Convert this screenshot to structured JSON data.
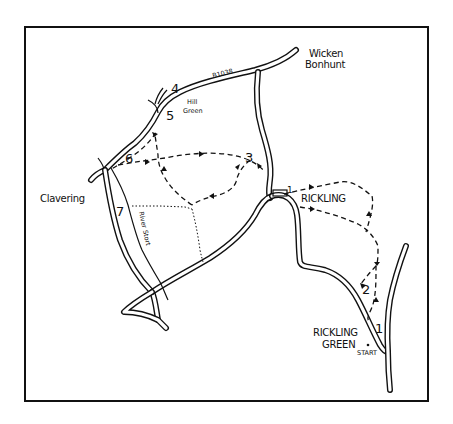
{
  "map": {
    "type": "hand-drawn walking route map",
    "frame": {
      "x": 25,
      "y": 27,
      "width": 403,
      "height": 374
    },
    "places": {
      "wicken_bonhunt_line1": "Wicken",
      "wicken_bonhunt_line2": "Bonhunt",
      "hill_green_line1": "Hill",
      "hill_green_line2": "Green",
      "clavering": "Clavering",
      "rickling": "RICKLING",
      "rickling_green_line1": "RICKLING",
      "rickling_green_line2": "GREEN"
    },
    "road_labels": {
      "b1038": "B1038"
    },
    "river_label": "River Stort",
    "start_label": "START",
    "waypoints": {
      "wp1_start": "1",
      "wp1_rickling": "1",
      "wp2": "2",
      "wp3": "3",
      "wp4": "4",
      "wp5": "5",
      "wp6": "6",
      "wp7": "7"
    },
    "colors": {
      "ink": "#111111",
      "paper": "#ffffff"
    }
  }
}
